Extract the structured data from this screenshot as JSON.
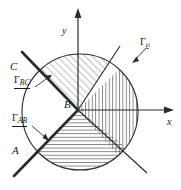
{
  "figure": {
    "background_color": "#ffffff",
    "line_color": "#2b2b2b",
    "hatch_color": "#565656",
    "width": 181,
    "height": 190
  },
  "axes": {
    "x_label": "x",
    "y_label": "y",
    "origin": {
      "x": 78,
      "y": 110
    }
  },
  "points": {
    "A": "A",
    "B": "B",
    "C": "C"
  },
  "curves": {
    "gamma_bc": {
      "base": "Γ",
      "subscript": "BC",
      "underlined": true
    },
    "gamma_ab": {
      "base": "Γ",
      "subscript": "AB",
      "underlined": true
    },
    "gamma_rho": {
      "base": "Γ",
      "subscript": "ϱ",
      "underlined": false
    }
  },
  "circle": {
    "center_x": 80,
    "center_y": 112,
    "radius": 58
  },
  "regions": [
    {
      "name": "upper-left-sector",
      "hatch": "diagonal-45"
    },
    {
      "name": "right-sector",
      "hatch": "vertical"
    },
    {
      "name": "lower-sector",
      "hatch": "horizontal"
    }
  ]
}
